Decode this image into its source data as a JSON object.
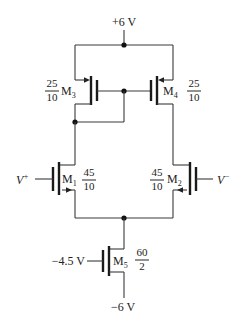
{
  "supplies": {
    "vdd": "+6 V",
    "vss": "−6 V",
    "bias": "−4.5 V"
  },
  "inputs": {
    "plus": "V",
    "plus_sup": "+",
    "minus": "V",
    "minus_sup": "−"
  },
  "transistors": [
    {
      "name": "M",
      "sub": "1",
      "w": "45",
      "l": "10",
      "type": "NMOS"
    },
    {
      "name": "M",
      "sub": "2",
      "w": "45",
      "l": "10",
      "type": "NMOS"
    },
    {
      "name": "M",
      "sub": "3",
      "w": "25",
      "l": "10",
      "type": "PMOS"
    },
    {
      "name": "M",
      "sub": "4",
      "w": "25",
      "l": "10",
      "type": "PMOS"
    },
    {
      "name": "M",
      "sub": "5",
      "w": "60",
      "l": "2",
      "type": "NMOS"
    }
  ]
}
